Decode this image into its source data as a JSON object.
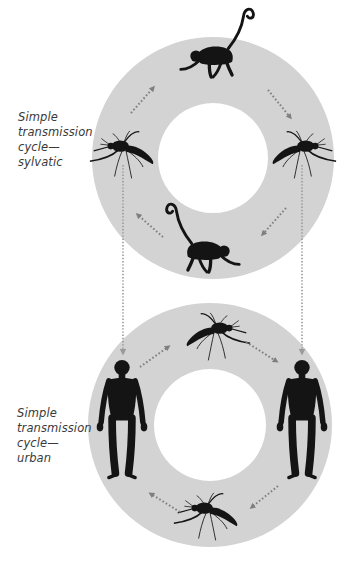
{
  "figure": {
    "width": 356,
    "height": 561,
    "colors": {
      "background": "#ffffff",
      "ring": "#d3d3d3",
      "silhouette": "#141414",
      "arrow": "#7f7f7f",
      "connector": "#9a9a9a",
      "label_text": "#3a3a3a"
    }
  },
  "cycles": [
    {
      "id": "sylvatic",
      "label_lines": [
        "Simple",
        "transmission",
        "cycle—",
        "sylvatic"
      ],
      "ring": {
        "cx": 213,
        "cy": 158,
        "r_outer": 121,
        "r_inner": 55
      },
      "hosts": [
        {
          "position": "top",
          "organism": "monkey",
          "icon": "spider-monkey-silhouette"
        },
        {
          "position": "right",
          "organism": "mosquito",
          "icon": "mosquito-silhouette"
        },
        {
          "position": "bottom",
          "organism": "monkey",
          "icon": "spider-monkey-silhouette"
        },
        {
          "position": "left",
          "organism": "mosquito",
          "icon": "mosquito-silhouette"
        }
      ],
      "arrows": [
        {
          "from": "left mosquito",
          "to": "top monkey",
          "direction": "up-right"
        },
        {
          "from": "top monkey",
          "to": "right mosquito",
          "direction": "down-right"
        },
        {
          "from": "right mosquito",
          "to": "bottom monkey",
          "direction": "down-left"
        },
        {
          "from": "bottom monkey",
          "to": "left mosquito",
          "direction": "up-left"
        }
      ]
    },
    {
      "id": "urban",
      "label_lines": [
        "Simple",
        "transmission",
        "cycle—",
        "urban"
      ],
      "ring": {
        "cx": 210,
        "cy": 425,
        "r_outer": 122,
        "r_inner": 56
      },
      "hosts": [
        {
          "position": "top",
          "organism": "mosquito",
          "icon": "mosquito-silhouette"
        },
        {
          "position": "right",
          "organism": "human",
          "icon": "human-silhouette"
        },
        {
          "position": "bottom",
          "organism": "mosquito",
          "icon": "mosquito-silhouette"
        },
        {
          "position": "left",
          "organism": "human",
          "icon": "human-silhouette"
        }
      ],
      "arrows": [
        {
          "from": "left human",
          "to": "top mosquito",
          "direction": "up-right"
        },
        {
          "from": "top mosquito",
          "to": "right human",
          "direction": "down-right"
        },
        {
          "from": "right human",
          "to": "bottom mosquito",
          "direction": "down-left"
        },
        {
          "from": "bottom mosquito",
          "to": "left human",
          "direction": "up-left"
        }
      ]
    }
  ],
  "connectors": [
    {
      "from": "sylvatic left mosquito",
      "to": "urban left human",
      "style": "dotted",
      "arrowhead": "down"
    },
    {
      "from": "sylvatic right mosquito",
      "to": "urban right human",
      "style": "dotted",
      "arrowhead": "down"
    }
  ]
}
